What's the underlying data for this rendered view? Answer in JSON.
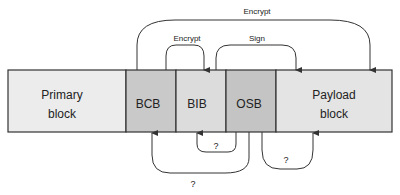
{
  "diagram": {
    "blocks": [
      {
        "id": "primary",
        "line1": "Primary",
        "line2": "block",
        "fill": "#ececec"
      },
      {
        "id": "bcb",
        "label": "BCB",
        "fill": "#c9c9c9"
      },
      {
        "id": "bib",
        "label": "BIB",
        "fill": "#dcdcdc"
      },
      {
        "id": "osb",
        "label": "OSB",
        "fill": "#c4c4c4"
      },
      {
        "id": "payload",
        "line1": "Payload",
        "line2": "block",
        "fill": "#e4e4e4"
      }
    ],
    "arrows": {
      "encrypt_outer": "Encrypt",
      "encrypt_inner": "Encrypt",
      "sign": "Sign",
      "q_osb_bib": "?",
      "q_osb_payload": "?",
      "q_osb_bcb": "?"
    }
  }
}
